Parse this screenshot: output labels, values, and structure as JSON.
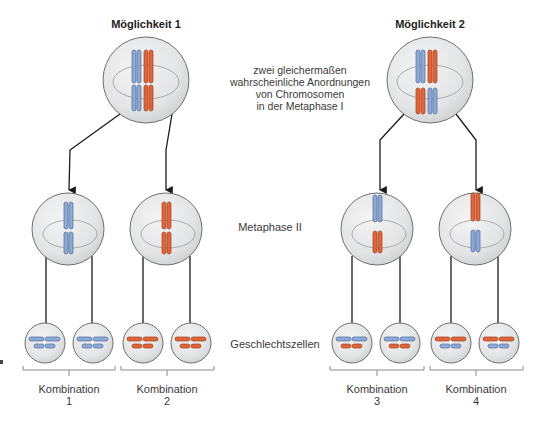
{
  "colors": {
    "maternal_blue": "#8eaad4",
    "paternal_orange": "#e0653a",
    "cell_fill": "#e6e7e8",
    "cell_stroke": "#6f6f6f",
    "arrow": "#1a1a1a"
  },
  "possibilities": [
    {
      "title": "Möglichkeit 1",
      "metaphase1_arrangement": {
        "top": [
          "blue",
          "orange"
        ],
        "bottom": [
          "blue",
          "orange"
        ]
      },
      "metaphase2_cells": [
        {
          "top": "blue",
          "bottom": "blue"
        },
        {
          "top": "orange",
          "bottom": "orange"
        }
      ],
      "gametes": [
        {
          "long": "blue",
          "short": "blue"
        },
        {
          "long": "blue",
          "short": "blue"
        },
        {
          "long": "orange",
          "short": "orange"
        },
        {
          "long": "orange",
          "short": "orange"
        }
      ],
      "combinations": [
        {
          "label": "Kombination",
          "number": "1"
        },
        {
          "label": "Kombination",
          "number": "2"
        }
      ]
    },
    {
      "title": "Möglichkeit 2",
      "metaphase1_arrangement": {
        "top": [
          "blue",
          "orange"
        ],
        "bottom": [
          "orange",
          "blue"
        ]
      },
      "metaphase2_cells": [
        {
          "top": "blue",
          "bottom": "orange"
        },
        {
          "top": "orange",
          "bottom": "blue"
        }
      ],
      "gametes": [
        {
          "long": "blue",
          "short": "orange"
        },
        {
          "long": "blue",
          "short": "orange"
        },
        {
          "long": "orange",
          "short": "blue"
        },
        {
          "long": "orange",
          "short": "blue"
        }
      ],
      "combinations": [
        {
          "label": "Kombination",
          "number": "3"
        },
        {
          "label": "Kombination",
          "number": "4"
        }
      ]
    }
  ],
  "stage_labels": {
    "metaphase1_note": [
      "zwei gleichermaßen",
      "wahrscheinliche Anordnungen",
      "von Chromosomen",
      "in der Metaphase I"
    ],
    "metaphase2": "Metaphase II",
    "gametes": "Geschlechtszellen"
  }
}
